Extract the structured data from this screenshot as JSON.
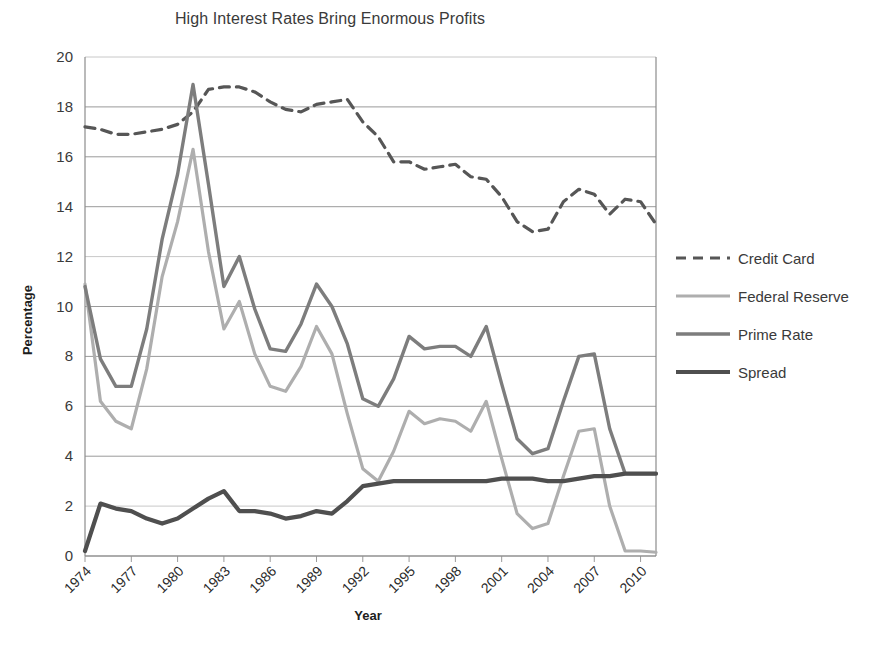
{
  "chart_data": {
    "type": "line",
    "title": "High Interest Rates Bring Enormous Profits",
    "xlabel": "Year",
    "ylabel": "Percentage",
    "ylim": [
      0,
      20
    ],
    "ytick_step": 2,
    "yticks": [
      "0",
      "2",
      "4",
      "6",
      "8",
      "10",
      "12",
      "14",
      "16",
      "18",
      "20"
    ],
    "xlim": [
      1974,
      2011
    ],
    "xticks": [
      "1974",
      "1977",
      "1980",
      "1983",
      "1986",
      "1989",
      "1992",
      "1995",
      "1998",
      "2001",
      "2004",
      "2007",
      "2010"
    ],
    "xtick_values": [
      1974,
      1977,
      1980,
      1983,
      1986,
      1989,
      1992,
      1995,
      1998,
      2001,
      2004,
      2007,
      2010
    ],
    "xtick_rotation_deg": 45,
    "grid": true,
    "legend_position": "right",
    "x": [
      1974,
      1975,
      1976,
      1977,
      1978,
      1979,
      1980,
      1981,
      1982,
      1983,
      1984,
      1985,
      1986,
      1987,
      1988,
      1989,
      1990,
      1991,
      1992,
      1993,
      1994,
      1995,
      1996,
      1997,
      1998,
      1999,
      2000,
      2001,
      2002,
      2003,
      2004,
      2005,
      2006,
      2007,
      2008,
      2009,
      2010,
      2011
    ],
    "series": [
      {
        "name": "Credit Card",
        "color": "#565656",
        "style": "dashed",
        "width": 3.2,
        "values": [
          17.2,
          17.1,
          16.9,
          16.9,
          17.0,
          17.1,
          17.3,
          17.8,
          18.7,
          18.8,
          18.8,
          18.6,
          18.2,
          17.9,
          17.8,
          18.1,
          18.2,
          18.3,
          17.4,
          16.8,
          15.8,
          15.8,
          15.5,
          15.6,
          15.7,
          15.2,
          15.1,
          14.4,
          13.4,
          13.0,
          13.1,
          14.2,
          14.7,
          14.5,
          13.7,
          14.3,
          14.2,
          13.3
        ]
      },
      {
        "name": "Federal Reserve",
        "color": "#aeaeae",
        "style": "solid",
        "width": 3.2,
        "values": [
          10.9,
          6.2,
          5.4,
          5.1,
          7.5,
          11.2,
          13.4,
          16.3,
          12.2,
          9.1,
          10.2,
          8.1,
          6.8,
          6.6,
          7.6,
          9.2,
          8.1,
          5.7,
          3.5,
          3.0,
          4.2,
          5.8,
          5.3,
          5.5,
          5.4,
          5.0,
          6.2,
          3.9,
          1.7,
          1.1,
          1.3,
          3.2,
          5.0,
          5.1,
          2.0,
          0.2,
          0.2,
          0.15
        ]
      },
      {
        "name": "Prime Rate",
        "color": "#7d7d7d",
        "style": "solid",
        "width": 3.4,
        "values": [
          10.8,
          7.9,
          6.8,
          6.8,
          9.1,
          12.7,
          15.3,
          18.9,
          14.9,
          10.8,
          12.0,
          9.9,
          8.3,
          8.2,
          9.3,
          10.9,
          10.0,
          8.5,
          6.3,
          6.0,
          7.1,
          8.8,
          8.3,
          8.4,
          8.4,
          8.0,
          9.2,
          6.9,
          4.7,
          4.1,
          4.3,
          6.2,
          8.0,
          8.1,
          5.1,
          3.3,
          3.3,
          3.3
        ]
      },
      {
        "name": "Spread",
        "color": "#4f4f4f",
        "style": "solid",
        "width": 4.2,
        "values": [
          0.2,
          2.1,
          1.9,
          1.8,
          1.5,
          1.3,
          1.5,
          1.9,
          2.3,
          2.6,
          1.8,
          1.8,
          1.7,
          1.5,
          1.6,
          1.8,
          1.7,
          2.2,
          2.8,
          2.9,
          3.0,
          3.0,
          3.0,
          3.0,
          3.0,
          3.0,
          3.0,
          3.1,
          3.1,
          3.1,
          3.0,
          3.0,
          3.1,
          3.2,
          3.2,
          3.3,
          3.3,
          3.3
        ]
      }
    ]
  },
  "legend": {
    "items": [
      {
        "label": "Credit Card"
      },
      {
        "label": "Federal Reserve"
      },
      {
        "label": "Prime Rate"
      },
      {
        "label": "Spread"
      }
    ]
  }
}
